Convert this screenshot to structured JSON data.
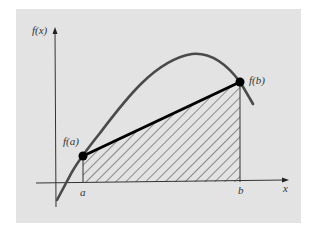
{
  "figure": {
    "type": "trapezoidal-rule-illustration",
    "colors": {
      "background_panel": "#e3e3e3",
      "curve": "#4a4a4a",
      "secant_line": "#000000",
      "axes": "#333333",
      "hatch": "#333333"
    },
    "labels": {
      "y_axis": "f(x)",
      "x_axis": "x",
      "point_a_value": "f(a)",
      "point_b_value": "f(b)",
      "a_tick": "a",
      "b_tick": "b"
    }
  }
}
